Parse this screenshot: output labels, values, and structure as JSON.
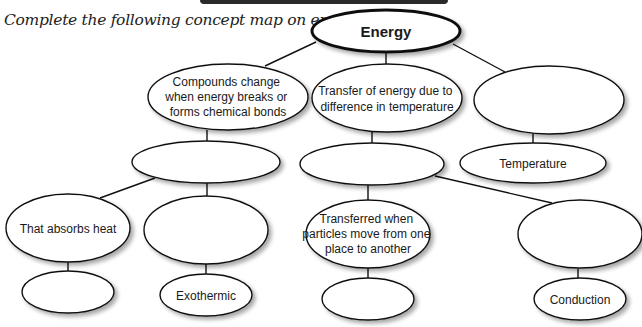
{
  "instruction": "Complete the following concept map on energy.",
  "colors": {
    "stroke": "#111111",
    "fill": "#ffffff",
    "shadow": "#bdbdbd",
    "header_bar": "#2a2a2a"
  },
  "nodes": {
    "root": {
      "lines": [
        "Energy"
      ]
    },
    "left": {
      "lines": [
        "Compounds change",
        "when energy breaks or",
        "forms chemical bonds"
      ]
    },
    "middle": {
      "lines": [
        "Transfer of energy due to",
        "difference in temperature"
      ]
    },
    "right": {
      "lines": [
        ""
      ]
    },
    "left_child": {
      "lines": [
        ""
      ]
    },
    "left_grandchild_a": {
      "lines": [
        "That absorbs heat"
      ]
    },
    "left_grandchild_b": {
      "lines": [
        ""
      ]
    },
    "left_leaf_a": {
      "lines": [
        ""
      ]
    },
    "left_leaf_b": {
      "lines": [
        "Exothermic"
      ]
    },
    "middle_child": {
      "lines": [
        ""
      ]
    },
    "middle_grandchild_a": {
      "lines": [
        "Transferred when",
        "particles move from one",
        "place to another"
      ]
    },
    "middle_grandchild_b": {
      "lines": [
        ""
      ]
    },
    "middle_leaf_a": {
      "lines": [
        ""
      ]
    },
    "middle_leaf_b": {
      "lines": [
        "Conduction"
      ]
    },
    "right_child": {
      "lines": [
        "Temperature"
      ]
    }
  }
}
